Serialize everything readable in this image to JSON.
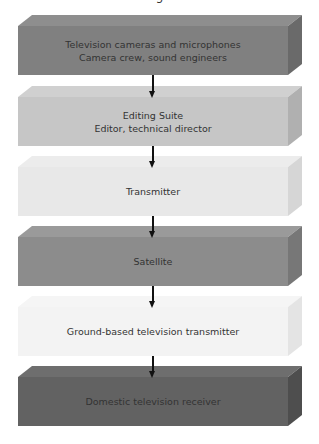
{
  "clipped_title_fragment": "g",
  "boxes": [
    {
      "lines": [
        "Television cameras and microphones",
        "Camera crew, sound engineers"
      ],
      "top": 15,
      "colors": {
        "front": "#808080",
        "top": "#8e8e8e",
        "side": "#6a6a6a"
      }
    },
    {
      "lines": [
        "Editing Suite",
        "Editor, technical director"
      ],
      "top": 86,
      "colors": {
        "front": "#c6c6c6",
        "top": "#d0d0d0",
        "side": "#b0b0b0"
      }
    },
    {
      "lines": [
        "Transmitter",
        ""
      ],
      "top": 156,
      "colors": {
        "front": "#e8e8e8",
        "top": "#ececec",
        "side": "#d6d6d6"
      }
    },
    {
      "lines": [
        "Satellite",
        ""
      ],
      "top": 226,
      "colors": {
        "front": "#8c8c8c",
        "top": "#9a9a9a",
        "side": "#777777"
      }
    },
    {
      "lines": [
        "Ground-based television transmitter",
        ""
      ],
      "top": 296,
      "colors": {
        "front": "#f3f3f3",
        "top": "#f5f5f5",
        "side": "#e4e4e4"
      }
    },
    {
      "lines": [
        "Domestic television receiver",
        ""
      ],
      "top": 366,
      "colors": {
        "front": "#626262",
        "top": "#6e6e6e",
        "side": "#4e4e4e"
      }
    }
  ],
  "arrows": [
    {
      "from": "Television cameras and microphones",
      "to": "Editing Suite",
      "top": 75,
      "height": 23
    },
    {
      "from": "Editing Suite",
      "to": "Transmitter",
      "top": 146,
      "height": 22
    },
    {
      "from": "Transmitter",
      "to": "Satellite",
      "top": 216,
      "height": 22
    },
    {
      "from": "Satellite",
      "to": "Ground-based television transmitter",
      "top": 286,
      "height": 22
    },
    {
      "from": "Ground-based television transmitter",
      "to": "Domestic television receiver",
      "top": 356,
      "height": 22
    }
  ]
}
